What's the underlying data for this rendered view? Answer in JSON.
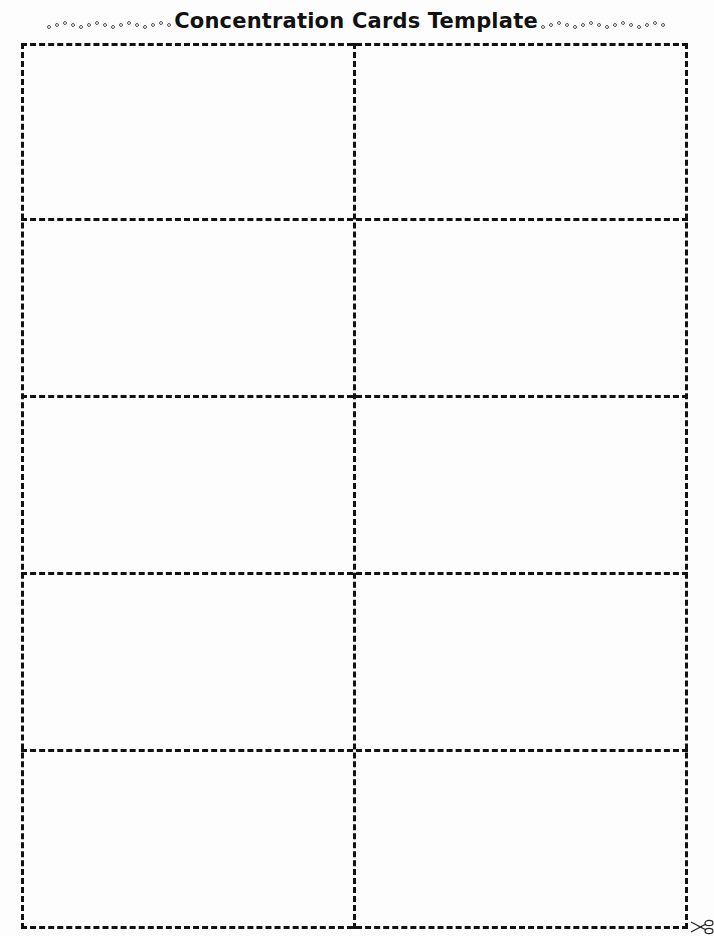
{
  "header": {
    "title": "Concentration Cards Template"
  },
  "grid": {
    "columns": 2,
    "rows": 5,
    "line_style": "dashed",
    "line_color": "#111111"
  },
  "cards": [
    {
      "row": 1,
      "col": 1,
      "content": ""
    },
    {
      "row": 1,
      "col": 2,
      "content": ""
    },
    {
      "row": 2,
      "col": 1,
      "content": ""
    },
    {
      "row": 2,
      "col": 2,
      "content": ""
    },
    {
      "row": 3,
      "col": 1,
      "content": ""
    },
    {
      "row": 3,
      "col": 2,
      "content": ""
    },
    {
      "row": 4,
      "col": 1,
      "content": ""
    },
    {
      "row": 4,
      "col": 2,
      "content": ""
    },
    {
      "row": 5,
      "col": 1,
      "content": ""
    },
    {
      "row": 5,
      "col": 2,
      "content": ""
    }
  ],
  "icons": {
    "cut_marker": "scissors-icon"
  }
}
